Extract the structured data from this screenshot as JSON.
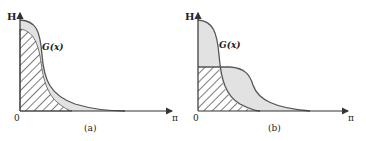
{
  "figure": {
    "panels": [
      {
        "id": "a",
        "caption": "(a)",
        "y_axis_label": "H",
        "x_origin_label": "0",
        "x_end_label": "π",
        "curve_label": "G(x)"
      },
      {
        "id": "b",
        "caption": "(b)",
        "y_axis_label": "H",
        "x_origin_label": "0",
        "x_end_label": "π",
        "curve_label": "G(x)"
      }
    ],
    "colors": {
      "curve": "#555555",
      "fill": "#e2e2e2",
      "hatch": "#444444",
      "axis": "#333333"
    }
  }
}
